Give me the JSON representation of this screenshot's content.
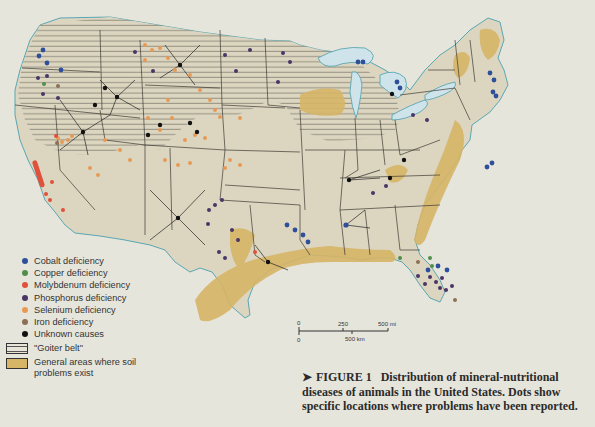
{
  "figure": {
    "caption_arrow": "➤",
    "caption_label": "FIGURE 1",
    "caption_text": "Distribution of mineral-nutritional diseases of animals in the United States. Dots show specific locations where problems have been reported."
  },
  "legend": {
    "items": [
      {
        "label": "Cobalt deficiency",
        "color": "#2e4f9a"
      },
      {
        "label": "Copper deficiency",
        "color": "#4f8f4a"
      },
      {
        "label": "Molybdenum deficiency",
        "color": "#e0503a"
      },
      {
        "label": "Phosphorus deficiency",
        "color": "#4a3566"
      },
      {
        "label": "Selenium deficiency",
        "color": "#e89a55"
      },
      {
        "label": "Iron deficiency",
        "color": "#8c6f55"
      },
      {
        "label": "Unknown causes",
        "color": "#111111"
      }
    ],
    "goiter_belt": "\"Goiter belt\"",
    "soil_problems": "General areas where soil problems exist"
  },
  "scale_bar": {
    "mi_zero": "0",
    "mi_mid": "250",
    "mi_end": "500 mi",
    "km_zero": "0",
    "km_end": "500 km"
  },
  "colors": {
    "land": "#dcd6c1",
    "water": "#cfe3ea",
    "coast": "#5aa6b3",
    "border": "#3e3a32",
    "hatch": "#57534a",
    "soil": "#d6b567",
    "paper": "#e6e5dc"
  }
}
